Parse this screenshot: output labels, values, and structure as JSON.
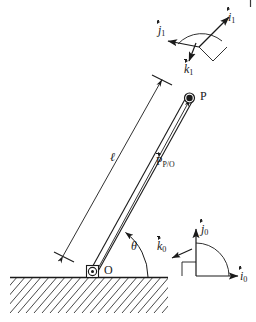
{
  "figure": {
    "background_color": "#ffffff",
    "ink_color": "#1a1a1a",
    "width": 256,
    "height": 322
  },
  "labels": {
    "point_p": "P",
    "point_o": "O",
    "length": "ℓ",
    "theta": "θ",
    "position_vector_head": "P",
    "position_vector_sub": "P/O",
    "i1": "i",
    "i1_sub": "1",
    "j1": "j",
    "j1_sub": "1",
    "k1": "k",
    "k1_sub": "1",
    "i0": "i",
    "i0_sub": "0",
    "j0": "j",
    "j0_sub": "0",
    "k0": "k",
    "k0_sub": "0"
  },
  "geometry": {
    "pivot_o": [
      93,
      272
    ],
    "point_p": [
      190,
      96
    ],
    "rod_angle_deg": 61,
    "ground_line_y": 277,
    "ground_left_x": 10,
    "ground_right_x": 168,
    "hatch_bottom_y": 312,
    "frame0_origin": [
      196,
      276
    ],
    "frame1_origin": [
      199,
      46
    ]
  },
  "elements": {
    "rod": "slender-bar-two-parallel-lines",
    "pivot_joint": "pin-joint-square-with-circle",
    "tip_marker": "filled-circle-with-ring",
    "length_dimension": "double-headed-arrow-with-end-ticks",
    "theta_arc": "arc-from-ground-to-rod-with-arrowhead",
    "ground": "hatched-half-plane-45-degree-lines",
    "frame1_arc": "quarter-arc-between-i1-and-j1",
    "frame0_arc": "quarter-arc-between-i0-and-j0"
  }
}
